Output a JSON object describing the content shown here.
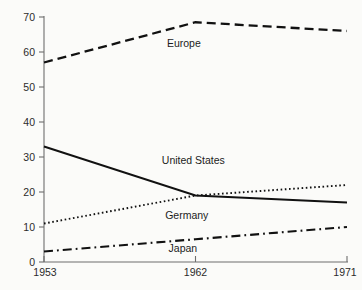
{
  "chart_data": {
    "type": "line",
    "title": "",
    "subtitle": "",
    "xlabel": "",
    "ylabel": "",
    "x": [
      1953,
      1962,
      1971
    ],
    "xtick_labels": [
      "1953",
      "1962",
      "1971"
    ],
    "ytick_labels": [
      "0",
      "10",
      "20",
      "30",
      "40",
      "50",
      "60",
      "70"
    ],
    "ytick_values": [
      0,
      10,
      20,
      30,
      40,
      50,
      60,
      70
    ],
    "ylim": [
      0,
      70
    ],
    "xlim": [
      1953,
      1971
    ],
    "grid": false,
    "legend_position": "inline-labels",
    "series": [
      {
        "name": "Europe",
        "values": [
          57,
          68.5,
          66
        ],
        "line_style": "dashed",
        "color": "#111111",
        "label_x": 1960.3,
        "label_y": 61.5
      },
      {
        "name": "United States",
        "values": [
          33,
          19,
          17
        ],
        "line_style": "solid",
        "color": "#111111",
        "label_x": 1960.0,
        "label_y": 28.0
      },
      {
        "name": "Germany",
        "values": [
          11,
          19,
          22
        ],
        "line_style": "dotted",
        "color": "#111111",
        "label_x": 1960.2,
        "label_y": 12.2
      },
      {
        "name": "Japan",
        "values": [
          3,
          6.5,
          10
        ],
        "line_style": "dashdot",
        "color": "#111111",
        "label_x": 1960.4,
        "label_y": 3.0
      }
    ]
  },
  "axes": {
    "y_axis_name": "y-axis",
    "x_axis_name": "x-axis"
  }
}
